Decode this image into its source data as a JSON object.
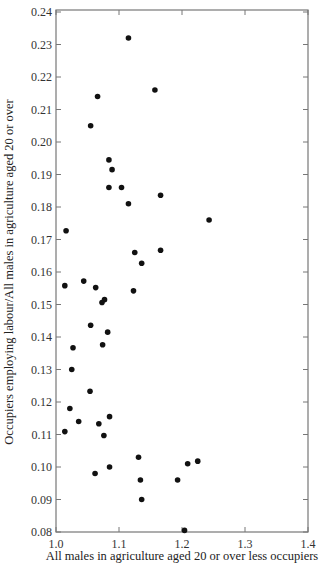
{
  "chart_data": {
    "type": "scatter",
    "title": "",
    "xlabel": "All males in agriculture aged 20 or over less occupiers",
    "ylabel": "Occupiers employing labour/All males in agriculture aged 20 or over",
    "xlim": [
      1.0,
      1.4
    ],
    "ylim": [
      0.08,
      0.24
    ],
    "xticks": [
      "1.0",
      "1.1",
      "1.2",
      "1.3",
      "1.4"
    ],
    "yticks": [
      "0.08",
      "0.09",
      "0.10",
      "0.11",
      "0.12",
      "0.13",
      "0.14",
      "0.15",
      "0.16",
      "0.17",
      "0.18",
      "0.19",
      "0.20",
      "0.21",
      "0.22",
      "0.23",
      "0.24"
    ],
    "grid": false,
    "legend": null,
    "marker_color": "#111111",
    "series": [
      {
        "name": "observations",
        "points": [
          {
            "x": 1.115,
            "y": 0.232
          },
          {
            "x": 1.157,
            "y": 0.216
          },
          {
            "x": 1.066,
            "y": 0.214
          },
          {
            "x": 1.055,
            "y": 0.205
          },
          {
            "x": 1.084,
            "y": 0.1945
          },
          {
            "x": 1.089,
            "y": 0.1915
          },
          {
            "x": 1.084,
            "y": 0.186
          },
          {
            "x": 1.104,
            "y": 0.186
          },
          {
            "x": 1.166,
            "y": 0.1836
          },
          {
            "x": 1.115,
            "y": 0.181
          },
          {
            "x": 1.243,
            "y": 0.176
          },
          {
            "x": 1.016,
            "y": 0.1727
          },
          {
            "x": 1.166,
            "y": 0.1667
          },
          {
            "x": 1.125,
            "y": 0.166
          },
          {
            "x": 1.136,
            "y": 0.1627
          },
          {
            "x": 1.044,
            "y": 0.1572
          },
          {
            "x": 1.014,
            "y": 0.1558
          },
          {
            "x": 1.063,
            "y": 0.1552
          },
          {
            "x": 1.123,
            "y": 0.1542
          },
          {
            "x": 1.077,
            "y": 0.1515
          },
          {
            "x": 1.073,
            "y": 0.1506
          },
          {
            "x": 1.055,
            "y": 0.1436
          },
          {
            "x": 1.082,
            "y": 0.1415
          },
          {
            "x": 1.074,
            "y": 0.1376
          },
          {
            "x": 1.027,
            "y": 0.1367
          },
          {
            "x": 1.025,
            "y": 0.13
          },
          {
            "x": 1.054,
            "y": 0.1233
          },
          {
            "x": 1.022,
            "y": 0.118
          },
          {
            "x": 1.085,
            "y": 0.1155
          },
          {
            "x": 1.036,
            "y": 0.114
          },
          {
            "x": 1.068,
            "y": 0.1133
          },
          {
            "x": 1.014,
            "y": 0.1109
          },
          {
            "x": 1.076,
            "y": 0.1097
          },
          {
            "x": 1.131,
            "y": 0.103
          },
          {
            "x": 1.225,
            "y": 0.1018
          },
          {
            "x": 1.209,
            "y": 0.101
          },
          {
            "x": 1.085,
            "y": 0.1
          },
          {
            "x": 1.062,
            "y": 0.098
          },
          {
            "x": 1.134,
            "y": 0.096
          },
          {
            "x": 1.193,
            "y": 0.096
          },
          {
            "x": 1.136,
            "y": 0.09
          },
          {
            "x": 1.204,
            "y": 0.0805
          }
        ]
      }
    ]
  }
}
